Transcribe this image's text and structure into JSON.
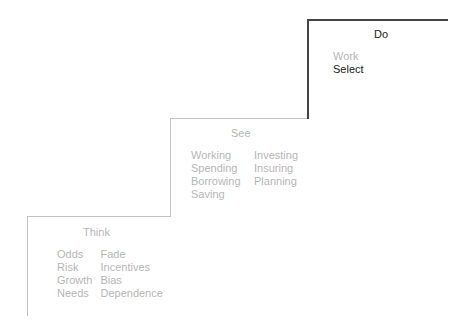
{
  "colors": {
    "light_text": "#b5b5b5",
    "dark_text": "#1a1a1a",
    "light_line": "#c2c2c2",
    "dark_line": "#444444",
    "background": "#ffffff"
  },
  "steps": [
    {
      "title": "Think",
      "words": {
        "col1": [
          "Odds",
          "Risk",
          "Growth",
          "Needs"
        ],
        "col2": [
          "Fade",
          "Incentives",
          "Bias",
          "Dependence"
        ]
      }
    },
    {
      "title": "See",
      "words": {
        "col1": [
          "Working",
          "Spending",
          "Borrowing",
          "Saving"
        ],
        "col2": [
          "Investing",
          "Insuring",
          "Planning"
        ]
      }
    },
    {
      "title": "Do",
      "words": {
        "col1": [
          "Work",
          "Select"
        ],
        "highlighted": "Select"
      }
    }
  ]
}
